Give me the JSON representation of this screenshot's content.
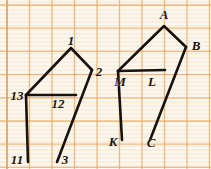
{
  "figure": {
    "background_color": "#fdf8ef",
    "grid_color": "#e8a45c",
    "stroke_color": "#17120e",
    "paper_texture_color": "#f7ecd9",
    "grid": {
      "cell_width": 22.5,
      "cell_height": 23.2,
      "origin_x": 7,
      "origin_y": 5,
      "columns": 9,
      "rows": 7
    },
    "labels": [
      {
        "id": "one",
        "text": "1",
        "x": 71,
        "y": 40
      },
      {
        "id": "two",
        "text": "2",
        "x": 99,
        "y": 71
      },
      {
        "id": "thirteen",
        "text": "13",
        "x": 17,
        "y": 95
      },
      {
        "id": "twelve",
        "text": "12",
        "x": 58,
        "y": 103
      },
      {
        "id": "eleven",
        "text": "11",
        "x": 17,
        "y": 159
      },
      {
        "id": "three",
        "text": "3",
        "x": 65,
        "y": 159
      },
      {
        "id": "A",
        "text": "A",
        "x": 164,
        "y": 14
      },
      {
        "id": "B",
        "text": "B",
        "x": 196,
        "y": 45
      },
      {
        "id": "M",
        "text": "M",
        "x": 120,
        "y": 81
      },
      {
        "id": "L",
        "text": "L",
        "x": 152,
        "y": 81
      },
      {
        "id": "K",
        "text": "K",
        "x": 113,
        "y": 141
      },
      {
        "id": "C",
        "text": "C",
        "x": 151,
        "y": 142
      }
    ],
    "paths": [
      {
        "id": "left-upper-chain",
        "name": "path-13-1-2",
        "points": "26,95 71,48 92,70"
      },
      {
        "id": "left-horizontal",
        "name": "segment-13-12",
        "points": "26,95 76,95"
      },
      {
        "id": "left-leg-11",
        "name": "segment-13-11",
        "points": "26,95 28,162"
      },
      {
        "id": "left-leg-3",
        "name": "segment-2-3",
        "points": "92,70 57,162"
      },
      {
        "id": "right-upper-chain",
        "name": "path-M-A-B",
        "points": "118,71 164,26 186,47"
      },
      {
        "id": "right-horizontal",
        "name": "segment-M-L",
        "points": "118,71 165,70"
      },
      {
        "id": "right-leg-K",
        "name": "segment-M-K",
        "points": "118,71 122,140"
      },
      {
        "id": "right-leg-C",
        "name": "segment-B-C",
        "points": "186,47 150,140"
      }
    ]
  }
}
